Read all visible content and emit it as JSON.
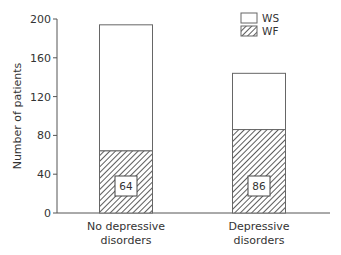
{
  "chart_data": {
    "type": "bar",
    "stacked": true,
    "title": "",
    "xlabel": "",
    "ylabel": "Number of patients",
    "ylim": [
      0,
      200
    ],
    "yticks": [
      0,
      40,
      80,
      120,
      160,
      200
    ],
    "categories": [
      "No depressive disorders",
      "Depressive disorders"
    ],
    "category_lines": [
      [
        "No depressive",
        "disorders"
      ],
      [
        "Depressive",
        "disorders"
      ]
    ],
    "series": [
      {
        "name": "WF",
        "pattern": "hatched",
        "values": [
          64,
          86
        ]
      },
      {
        "name": "WS",
        "pattern": "white",
        "values": [
          130,
          58
        ]
      }
    ],
    "totals": [
      194,
      144
    ],
    "annotations": [
      "64",
      "86"
    ],
    "legend": {
      "position": "top-right",
      "entries": [
        "WS",
        "WF"
      ]
    },
    "grid": false
  }
}
